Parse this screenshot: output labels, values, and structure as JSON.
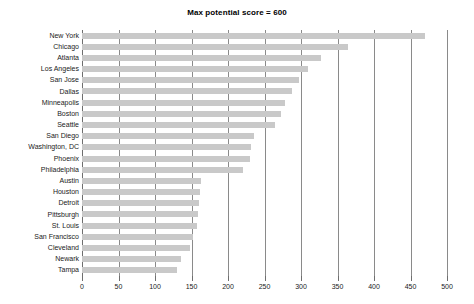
{
  "chart_data": {
    "type": "bar",
    "orientation": "horizontal",
    "title": "Max potential score = 600",
    "xlabel": "",
    "ylabel": "",
    "xlim": [
      0,
      500
    ],
    "ylim": null,
    "grid": true,
    "legend": null,
    "xticks": [
      0,
      50,
      100,
      150,
      200,
      250,
      300,
      350,
      400,
      450,
      500
    ],
    "xtick_labels": [
      "0",
      "50",
      "100",
      "150",
      "200",
      "250",
      "300",
      "350",
      "400",
      "450",
      "500"
    ],
    "categories": [
      "New York",
      "Chicago",
      "Atlanta",
      "Los Angeles",
      "San Jose",
      "Dallas",
      "Minneapolis",
      "Boston",
      "Seattle",
      "San Diego",
      "Washington, DC",
      "Phoenix",
      "Philadelphia",
      "Austin",
      "Houston",
      "Detroit",
      "Pittsburgh",
      "St. Louis",
      "San Francisco",
      "Cleveland",
      "Newark",
      "Tampa"
    ],
    "values": [
      470,
      365,
      327,
      310,
      297,
      288,
      278,
      272,
      265,
      235,
      232,
      230,
      220,
      163,
      162,
      160,
      159,
      158,
      152,
      148,
      135,
      130
    ],
    "bar_color": "#c9c9c9",
    "grid_color": "#8a8a8a",
    "axis_color": "#6e6e6e"
  }
}
